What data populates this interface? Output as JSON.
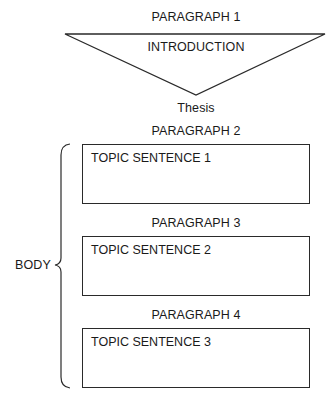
{
  "introduction": {
    "heading": "PARAGRAPH 1",
    "label": "INTRODUCTION",
    "thesis": "Thesis"
  },
  "body": {
    "label": "BODY",
    "paragraphs": [
      {
        "heading": "PARAGRAPH 2",
        "topic": "TOPIC SENTENCE 1"
      },
      {
        "heading": "PARAGRAPH 3",
        "topic": "TOPIC SENTENCE 2"
      },
      {
        "heading": "PARAGRAPH 4",
        "topic": "TOPIC SENTENCE 3"
      }
    ]
  },
  "colors": {
    "line": "#2a2a2a",
    "text": "#1a1a1a",
    "background": "#ffffff"
  }
}
